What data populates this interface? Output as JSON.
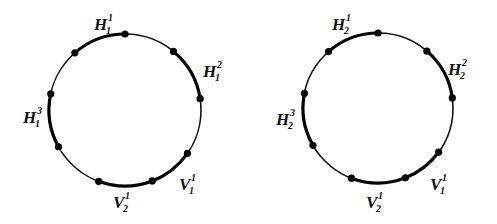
{
  "diagram": {
    "type": "two circles with marked arcs",
    "circles": [
      {
        "id": "left",
        "center": [
          125,
          110
        ],
        "radius": 76,
        "dots": [
          [
            125,
            33
          ],
          [
            75,
            53
          ],
          [
            173,
            52
          ],
          [
            198,
            99
          ],
          [
            52,
            94
          ],
          [
            58,
            147
          ],
          [
            187,
            153
          ],
          [
            98,
            183
          ],
          [
            153,
            183
          ]
        ],
        "thick_arcs": [
          {
            "from": [
              75,
              53
            ],
            "to": [
              125,
              33
            ]
          },
          {
            "from": [
              173,
              52
            ],
            "to": [
              198,
              99
            ]
          },
          {
            "from": [
              52,
              94
            ],
            "to": [
              58,
              147
            ]
          },
          {
            "from": [
              153,
              183
            ],
            "to": [
              187,
              153
            ]
          },
          {
            "from": [
              98,
              183
            ],
            "to": [
              153,
              183
            ]
          }
        ],
        "labels": [
          {
            "base": "H",
            "sub": "1",
            "sup": "1",
            "x": 94,
            "y": 30
          },
          {
            "base": "H",
            "sub": "1",
            "sup": "2",
            "x": 203,
            "y": 77
          },
          {
            "base": "H",
            "sub": "1",
            "sup": "3",
            "x": 23,
            "y": 123
          },
          {
            "base": "V",
            "sub": "1",
            "sup": "1",
            "x": 179,
            "y": 190
          },
          {
            "base": "V",
            "sub": "2",
            "sup": "1",
            "x": 113,
            "y": 208
          }
        ]
      },
      {
        "id": "right",
        "center": [
          378,
          108
        ],
        "radius": 75,
        "dots": [
          [
            378,
            33
          ],
          [
            328,
            51
          ],
          [
            427,
            51
          ],
          [
            452,
            98
          ],
          [
            303,
            93
          ],
          [
            310,
            147
          ],
          [
            440,
            153
          ],
          [
            350,
            182
          ],
          [
            407,
            182
          ]
        ],
        "thick_arcs": [
          {
            "from": [
              328,
              51
            ],
            "to": [
              378,
              33
            ]
          },
          {
            "from": [
              427,
              51
            ],
            "to": [
              452,
              98
            ]
          },
          {
            "from": [
              303,
              93
            ],
            "to": [
              310,
              147
            ]
          },
          {
            "from": [
              407,
              182
            ],
            "to": [
              440,
              153
            ]
          },
          {
            "from": [
              350,
              182
            ],
            "to": [
              407,
              182
            ]
          }
        ],
        "labels": [
          {
            "base": "H",
            "sub": "2",
            "sup": "1",
            "x": 332,
            "y": 30
          },
          {
            "base": "H",
            "sub": "2",
            "sup": "2",
            "x": 448,
            "y": 75
          },
          {
            "base": "H",
            "sub": "2",
            "sup": "3",
            "x": 276,
            "y": 125
          },
          {
            "base": "V",
            "sub": "1",
            "sup": "1",
            "x": 430,
            "y": 190
          },
          {
            "base": "V",
            "sub": "2",
            "sup": "1",
            "x": 366,
            "y": 208
          }
        ]
      }
    ]
  },
  "labels_text": {
    "left": [
      "H1^1",
      "H1^2",
      "H1^3",
      "V1^1",
      "V2^1"
    ],
    "right": [
      "H2^1",
      "H2^2",
      "H2^3",
      "V1^1",
      "V2^1"
    ]
  }
}
